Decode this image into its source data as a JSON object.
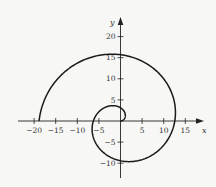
{
  "chart_data": {
    "type": "line",
    "title": "",
    "equation": "r = 2θ",
    "theta_range": [
      0,
      9.42477796
    ],
    "xlabel": "x",
    "ylabel": "y",
    "xlim": [
      -22,
      18.5
    ],
    "ylim": [
      -13.5,
      24
    ],
    "x_ticks": [
      -20,
      -15,
      -10,
      -5,
      5,
      10,
      15
    ],
    "x_tick_labels": [
      "−20",
      "−15",
      "−10",
      "−5",
      "5",
      "10",
      "15"
    ],
    "y_ticks": [
      20,
      15,
      10,
      5,
      -5,
      -10
    ],
    "y_tick_labels": [
      "20",
      "15",
      "10",
      "5",
      "−5",
      "−10"
    ],
    "grid": false,
    "legend": null,
    "key_points": [
      {
        "x": 0,
        "y": 0
      },
      {
        "x": 0,
        "y": 3.14
      },
      {
        "x": -6.28,
        "y": 0
      },
      {
        "x": 0,
        "y": -9.42
      },
      {
        "x": 12.57,
        "y": 0
      },
      {
        "x": 0,
        "y": 15.71
      },
      {
        "x": -18.85,
        "y": 0
      }
    ],
    "line_color": "#1a1a1a",
    "axis_color": "#222222"
  }
}
